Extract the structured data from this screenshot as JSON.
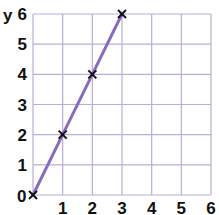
{
  "chart_data": {
    "type": "line",
    "title": "",
    "xlabel": "",
    "ylabel": "y",
    "x": [
      0,
      1,
      2,
      3
    ],
    "series": [
      {
        "name": "y = 2x",
        "values": [
          0,
          2,
          4,
          6
        ],
        "color": "#8a6bbf",
        "marker": "x"
      }
    ],
    "xlim": [
      0,
      6
    ],
    "ylim": [
      0,
      6
    ],
    "x_ticks": [
      "0",
      "1",
      "2",
      "3",
      "4",
      "5",
      "6"
    ],
    "y_ticks": [
      "0",
      "1",
      "2",
      "3",
      "4",
      "5",
      "6"
    ],
    "grid": true,
    "grid_color": "#b9aed6",
    "legend": null
  },
  "labels": {
    "y_axis": "y",
    "origin": "0",
    "x_ticks": [
      "1",
      "2",
      "3",
      "4",
      "5",
      "6"
    ],
    "y_ticks": [
      "1",
      "2",
      "3",
      "4",
      "5",
      "6"
    ]
  },
  "colors": {
    "line": "#8a6bbf",
    "grid": "#b9aed6",
    "marker": "#111111"
  }
}
